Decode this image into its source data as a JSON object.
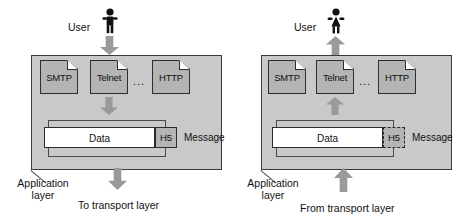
{
  "diagram": {
    "colors": {
      "panel_fill": "#c9c9c9",
      "panel_stroke": "#3a3a3a",
      "icon_fill": "#b4b4b4",
      "arrow_fill": "#9a9a9a",
      "data_fill": "#ffffff",
      "text": "#111111"
    }
  },
  "left": {
    "user_label": "User",
    "user_icon": "person-male-icon",
    "flow_direction": "down",
    "protocols": [
      {
        "label": "SMTP",
        "icon": "document-icon"
      },
      {
        "label": "Telnet",
        "icon": "document-icon"
      },
      {
        "label": "HTTP",
        "icon": "document-icon"
      }
    ],
    "ellipsis": "...",
    "data_label": "Data",
    "header_label": "H5",
    "header_style": "solid",
    "message_label": "Message",
    "layer_label": "Application\nlayer",
    "transport_label": "To transport layer"
  },
  "right": {
    "user_label": "User",
    "user_icon": "person-female-icon",
    "flow_direction": "up",
    "protocols": [
      {
        "label": "SMTP",
        "icon": "document-icon"
      },
      {
        "label": "Telnet",
        "icon": "document-icon"
      },
      {
        "label": "HTTP",
        "icon": "document-icon"
      }
    ],
    "ellipsis": "...",
    "data_label": "Data",
    "header_label": "H5",
    "header_style": "dashed",
    "message_label": "Message",
    "layer_label": "Application\nlayer",
    "transport_label": "From transport layer"
  }
}
